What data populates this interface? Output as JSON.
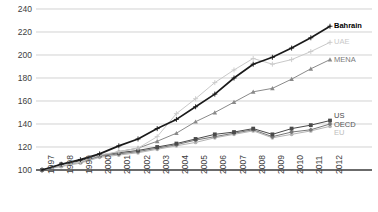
{
  "chart_data": {
    "type": "line",
    "title": "",
    "subtitle": "",
    "xlabel": "",
    "ylabel": "",
    "x": [
      1997,
      1998,
      1999,
      2000,
      2001,
      2002,
      2003,
      2004,
      2005,
      2006,
      2007,
      2008,
      2009,
      2010,
      2011,
      2012
    ],
    "categories": [
      "1997",
      "1998",
      "1999",
      "2000",
      "2001",
      "2002",
      "2003",
      "2004",
      "2005",
      "2006",
      "2007",
      "2008",
      "2009",
      "2010",
      "2011",
      "2012"
    ],
    "ylim": [
      100,
      240
    ],
    "yticks": [
      100,
      120,
      140,
      160,
      180,
      200,
      220,
      240
    ],
    "grid": true,
    "legend_position": "right-inline",
    "series": [
      {
        "name": "Bahrain",
        "color": "#1a1a1a",
        "label_color": "#000000",
        "bold": true,
        "marker": "plus",
        "values": [
          100,
          105,
          109,
          114,
          121,
          127,
          136,
          144,
          155,
          166,
          180,
          192,
          198,
          206,
          215,
          225
        ]
      },
      {
        "name": "UAE",
        "color": "#c9c9c9",
        "label_color": "#c9c9c9",
        "bold": false,
        "marker": "plus",
        "values": [
          100,
          104,
          107,
          113,
          116,
          119,
          129,
          149,
          162,
          176,
          187,
          197,
          192,
          196,
          203,
          211
        ]
      },
      {
        "name": "MENA",
        "color": "#8a8a8a",
        "label_color": "#7a7a7a",
        "bold": false,
        "marker": "triangle",
        "values": [
          100,
          104,
          107,
          112,
          116,
          119,
          125,
          132,
          142,
          150,
          159,
          168,
          171,
          179,
          188,
          196
        ]
      },
      {
        "name": "US",
        "color": "#4a4a4a",
        "label_color": "#4a4a4a",
        "bold": false,
        "marker": "square",
        "values": [
          100,
          105,
          108,
          113,
          115,
          117,
          120,
          123,
          127,
          131,
          133,
          136,
          131,
          136,
          139,
          143
        ]
      },
      {
        "name": "OECD",
        "color": "#777777",
        "label_color": "#555555",
        "bold": false,
        "marker": "diamond",
        "values": [
          100,
          104,
          107,
          112,
          114,
          116,
          119,
          122,
          126,
          129,
          132,
          135,
          129,
          133,
          135,
          140
        ]
      },
      {
        "name": "EU",
        "color": "#b5b5b5",
        "label_color": "#bdbdbd",
        "bold": false,
        "marker": "circle",
        "values": [
          100,
          103,
          106,
          111,
          113,
          115,
          118,
          121,
          124,
          128,
          131,
          134,
          128,
          131,
          134,
          138
        ]
      }
    ]
  },
  "axis": {
    "y_labels": [
      "240",
      "220",
      "200",
      "180",
      "160",
      "140",
      "120",
      "100"
    ],
    "x_labels": [
      "1997",
      "1998",
      "1999",
      "2000",
      "2001",
      "2002",
      "2003",
      "2004",
      "2005",
      "2006",
      "2007",
      "2008",
      "2009",
      "2010",
      "2011",
      "2012"
    ]
  },
  "legend": {
    "items": [
      {
        "label": "Bahrain"
      },
      {
        "label": "UAE"
      },
      {
        "label": "MENA"
      },
      {
        "label": "US"
      },
      {
        "label": "OECD"
      },
      {
        "label": "EU"
      }
    ]
  }
}
